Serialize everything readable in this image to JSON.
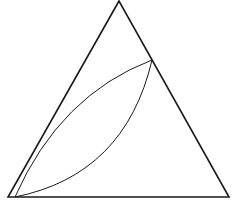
{
  "diagram": {
    "type": "geometric-figure",
    "stroke_color": "#1a1a1a",
    "background": "#ffffff",
    "triangle": {
      "apex": [
        119,
        1
      ],
      "bottom_left": [
        8,
        197
      ],
      "bottom_right": [
        229,
        197
      ]
    },
    "lens": {
      "endpoint_top": [
        152,
        60
      ],
      "endpoint_bottom": [
        15,
        197
      ],
      "upper_arc_control": [
        60,
        95
      ],
      "lower_arc_control": [
        125,
        175
      ]
    }
  }
}
